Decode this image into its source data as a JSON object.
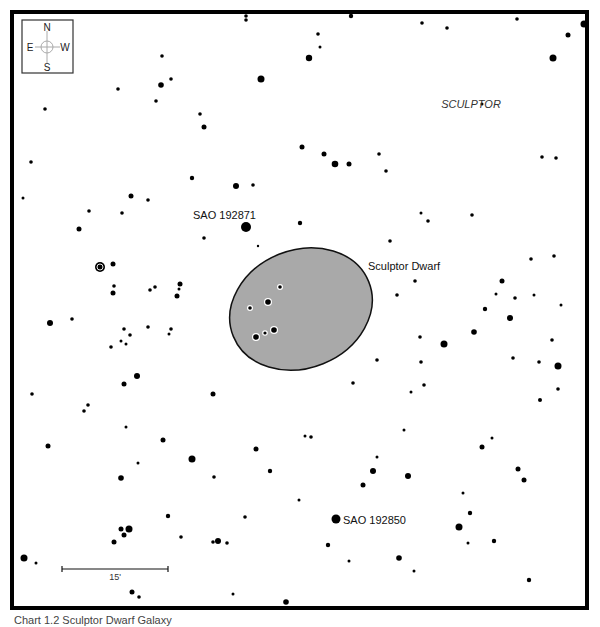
{
  "chart": {
    "constellation_label": "SCULPTOR",
    "galaxy": {
      "label": "Sculptor Dwarf",
      "fill": "#a9a9a9",
      "stroke": "#111111",
      "cx": 301,
      "cy": 309,
      "rx": 73,
      "ry": 59,
      "rotation": -22,
      "stars": [
        {
          "x": 280,
          "y": 287,
          "r": 1.8
        },
        {
          "x": 268,
          "y": 302,
          "r": 2.8
        },
        {
          "x": 250,
          "y": 308,
          "r": 1.8
        },
        {
          "x": 274,
          "y": 330,
          "r": 2.8
        },
        {
          "x": 265,
          "y": 333,
          "r": 1.6
        },
        {
          "x": 256,
          "y": 337,
          "r": 2.8
        }
      ]
    },
    "labeled_stars": [
      {
        "name": "SAO 192871",
        "x": 246,
        "y": 227,
        "r": 5,
        "label_x": 193,
        "label_y": 219
      },
      {
        "name": "SAO 192850",
        "x": 336,
        "y": 519,
        "r": 4.5,
        "label_x": 343,
        "label_y": 524
      }
    ],
    "variable_star": {
      "x": 100,
      "y": 267,
      "r": 5
    },
    "compass": {
      "n": "N",
      "s": "S",
      "e": "E",
      "w": "W"
    },
    "scale_bar": {
      "label": "15'",
      "x1": 62,
      "x2": 168,
      "y": 569
    },
    "caption": "Chart 1.2 Sculptor Dwarf Galaxy",
    "stars": [
      {
        "x": 246,
        "y": 16,
        "r": 1.8
      },
      {
        "x": 246,
        "y": 20,
        "r": 1.8
      },
      {
        "x": 162,
        "y": 56,
        "r": 1.8
      },
      {
        "x": 171,
        "y": 79,
        "r": 1.8
      },
      {
        "x": 161,
        "y": 85,
        "r": 2.8
      },
      {
        "x": 118,
        "y": 89,
        "r": 1.8
      },
      {
        "x": 156,
        "y": 101,
        "r": 1.8
      },
      {
        "x": 45,
        "y": 109,
        "r": 1.8
      },
      {
        "x": 200,
        "y": 114,
        "r": 1.8
      },
      {
        "x": 204,
        "y": 127,
        "r": 2.5
      },
      {
        "x": 261,
        "y": 79,
        "r": 3.5
      },
      {
        "x": 309,
        "y": 58,
        "r": 3.2
      },
      {
        "x": 302,
        "y": 147,
        "r": 2.5
      },
      {
        "x": 31,
        "y": 162,
        "r": 1.8
      },
      {
        "x": 192,
        "y": 178,
        "r": 2.2
      },
      {
        "x": 236,
        "y": 186,
        "r": 3
      },
      {
        "x": 253,
        "y": 185,
        "r": 1.8
      },
      {
        "x": 23,
        "y": 198,
        "r": 1.5
      },
      {
        "x": 131,
        "y": 196,
        "r": 2.5
      },
      {
        "x": 148,
        "y": 200,
        "r": 1.8
      },
      {
        "x": 351,
        "y": 16,
        "r": 2.2
      },
      {
        "x": 318,
        "y": 34,
        "r": 1.8
      },
      {
        "x": 320,
        "y": 47,
        "r": 1.5
      },
      {
        "x": 422,
        "y": 23,
        "r": 1.8
      },
      {
        "x": 447,
        "y": 28,
        "r": 1.8
      },
      {
        "x": 517,
        "y": 19,
        "r": 1.8
      },
      {
        "x": 584,
        "y": 24,
        "r": 3.5
      },
      {
        "x": 568,
        "y": 35,
        "r": 2.5
      },
      {
        "x": 553,
        "y": 58,
        "r": 3.5
      },
      {
        "x": 482,
        "y": 104,
        "r": 1.5
      },
      {
        "x": 324,
        "y": 154,
        "r": 2.5
      },
      {
        "x": 335,
        "y": 164,
        "r": 3.3
      },
      {
        "x": 349,
        "y": 164,
        "r": 2.5
      },
      {
        "x": 379,
        "y": 154,
        "r": 1.8
      },
      {
        "x": 386,
        "y": 171,
        "r": 1.8
      },
      {
        "x": 542,
        "y": 157,
        "r": 1.8
      },
      {
        "x": 556,
        "y": 158,
        "r": 1.8
      },
      {
        "x": 89,
        "y": 211,
        "r": 1.8
      },
      {
        "x": 122,
        "y": 213,
        "r": 1.8
      },
      {
        "x": 79,
        "y": 229,
        "r": 2.5
      },
      {
        "x": 204,
        "y": 238,
        "r": 1.8
      },
      {
        "x": 300,
        "y": 223,
        "r": 2.2
      },
      {
        "x": 258,
        "y": 246,
        "r": 1.2
      },
      {
        "x": 113,
        "y": 264,
        "r": 2.5
      },
      {
        "x": 114,
        "y": 286,
        "r": 1.8
      },
      {
        "x": 113,
        "y": 293,
        "r": 2.5
      },
      {
        "x": 150,
        "y": 290,
        "r": 1.8
      },
      {
        "x": 155,
        "y": 287,
        "r": 1.8
      },
      {
        "x": 180,
        "y": 284,
        "r": 2.5
      },
      {
        "x": 179,
        "y": 289,
        "r": 1.5
      },
      {
        "x": 177,
        "y": 296,
        "r": 2.5
      },
      {
        "x": 50,
        "y": 323,
        "r": 3
      },
      {
        "x": 72,
        "y": 319,
        "r": 1.8
      },
      {
        "x": 124,
        "y": 329,
        "r": 1.8
      },
      {
        "x": 130,
        "y": 335,
        "r": 1.8
      },
      {
        "x": 121,
        "y": 341,
        "r": 1.5
      },
      {
        "x": 126,
        "y": 344,
        "r": 1.5
      },
      {
        "x": 148,
        "y": 327,
        "r": 1.8
      },
      {
        "x": 171,
        "y": 329,
        "r": 1.8
      },
      {
        "x": 169,
        "y": 334,
        "r": 1.5
      },
      {
        "x": 111,
        "y": 347,
        "r": 1.8
      },
      {
        "x": 137,
        "y": 376,
        "r": 3
      },
      {
        "x": 124,
        "y": 384,
        "r": 2.5
      },
      {
        "x": 32,
        "y": 394,
        "r": 1.8
      },
      {
        "x": 88,
        "y": 405,
        "r": 1.8
      },
      {
        "x": 84,
        "y": 411,
        "r": 1.8
      },
      {
        "x": 213,
        "y": 394,
        "r": 2.5
      },
      {
        "x": 421,
        "y": 213,
        "r": 1.5
      },
      {
        "x": 428,
        "y": 221,
        "r": 1.8
      },
      {
        "x": 472,
        "y": 215,
        "r": 1.8
      },
      {
        "x": 390,
        "y": 241,
        "r": 1.8
      },
      {
        "x": 531,
        "y": 259,
        "r": 1.8
      },
      {
        "x": 554,
        "y": 256,
        "r": 1.8
      },
      {
        "x": 415,
        "y": 281,
        "r": 1.8
      },
      {
        "x": 397,
        "y": 295,
        "r": 1.8
      },
      {
        "x": 502,
        "y": 281,
        "r": 2.5
      },
      {
        "x": 496,
        "y": 294,
        "r": 1.5
      },
      {
        "x": 515,
        "y": 298,
        "r": 1.8
      },
      {
        "x": 534,
        "y": 295,
        "r": 1.5
      },
      {
        "x": 561,
        "y": 305,
        "r": 1.5
      },
      {
        "x": 485,
        "y": 309,
        "r": 2.2
      },
      {
        "x": 510,
        "y": 318,
        "r": 3
      },
      {
        "x": 474,
        "y": 332,
        "r": 2.8
      },
      {
        "x": 444,
        "y": 344,
        "r": 3.5
      },
      {
        "x": 420,
        "y": 337,
        "r": 1.8
      },
      {
        "x": 552,
        "y": 340,
        "r": 1.8
      },
      {
        "x": 377,
        "y": 360,
        "r": 1.8
      },
      {
        "x": 421,
        "y": 362,
        "r": 1.8
      },
      {
        "x": 513,
        "y": 358,
        "r": 1.8
      },
      {
        "x": 539,
        "y": 362,
        "r": 1.8
      },
      {
        "x": 558,
        "y": 366,
        "r": 3.5
      },
      {
        "x": 424,
        "y": 385,
        "r": 1.8
      },
      {
        "x": 411,
        "y": 392,
        "r": 1.5
      },
      {
        "x": 558,
        "y": 389,
        "r": 1.8
      },
      {
        "x": 540,
        "y": 400,
        "r": 2
      },
      {
        "x": 126,
        "y": 427,
        "r": 1.5
      },
      {
        "x": 48,
        "y": 446,
        "r": 2.5
      },
      {
        "x": 163,
        "y": 440,
        "r": 2.5
      },
      {
        "x": 192,
        "y": 459,
        "r": 3.5
      },
      {
        "x": 138,
        "y": 463,
        "r": 1.5
      },
      {
        "x": 121,
        "y": 478,
        "r": 2.8
      },
      {
        "x": 214,
        "y": 477,
        "r": 1.8
      },
      {
        "x": 256,
        "y": 449,
        "r": 2.5
      },
      {
        "x": 270,
        "y": 471,
        "r": 2.2
      },
      {
        "x": 299,
        "y": 500,
        "r": 1.5
      },
      {
        "x": 168,
        "y": 516,
        "r": 2.2
      },
      {
        "x": 245,
        "y": 517,
        "r": 1.8
      },
      {
        "x": 121,
        "y": 529,
        "r": 2.5
      },
      {
        "x": 124,
        "y": 535,
        "r": 2.5
      },
      {
        "x": 129,
        "y": 529,
        "r": 3.5
      },
      {
        "x": 114,
        "y": 542,
        "r": 2.5
      },
      {
        "x": 181,
        "y": 537,
        "r": 1.8
      },
      {
        "x": 213,
        "y": 542,
        "r": 1.8
      },
      {
        "x": 218,
        "y": 541,
        "r": 3
      },
      {
        "x": 227,
        "y": 543,
        "r": 1.8
      },
      {
        "x": 24,
        "y": 558,
        "r": 3.5
      },
      {
        "x": 36,
        "y": 563,
        "r": 1.5
      },
      {
        "x": 132,
        "y": 592,
        "r": 2.5
      },
      {
        "x": 139,
        "y": 597,
        "r": 1.8
      },
      {
        "x": 233,
        "y": 594,
        "r": 1.5
      },
      {
        "x": 286,
        "y": 602,
        "r": 2.8
      },
      {
        "x": 305,
        "y": 436,
        "r": 1.5
      },
      {
        "x": 311,
        "y": 437,
        "r": 1.8
      },
      {
        "x": 353,
        "y": 383,
        "r": 1.8
      },
      {
        "x": 404,
        "y": 430,
        "r": 1.5
      },
      {
        "x": 377,
        "y": 457,
        "r": 1.5
      },
      {
        "x": 482,
        "y": 447,
        "r": 2.5
      },
      {
        "x": 492,
        "y": 438,
        "r": 1.5
      },
      {
        "x": 373,
        "y": 471,
        "r": 3
      },
      {
        "x": 408,
        "y": 476,
        "r": 3
      },
      {
        "x": 363,
        "y": 485,
        "r": 2.5
      },
      {
        "x": 518,
        "y": 469,
        "r": 2.5
      },
      {
        "x": 524,
        "y": 480,
        "r": 2.5
      },
      {
        "x": 463,
        "y": 493,
        "r": 1.5
      },
      {
        "x": 470,
        "y": 513,
        "r": 2.2
      },
      {
        "x": 459,
        "y": 527,
        "r": 3.5
      },
      {
        "x": 328,
        "y": 545,
        "r": 2.2
      },
      {
        "x": 468,
        "y": 543,
        "r": 1.5
      },
      {
        "x": 494,
        "y": 541,
        "r": 2.2
      },
      {
        "x": 349,
        "y": 561,
        "r": 1.5
      },
      {
        "x": 399,
        "y": 558,
        "r": 2.8
      },
      {
        "x": 414,
        "y": 571,
        "r": 1.5
      },
      {
        "x": 529,
        "y": 580,
        "r": 2.2
      }
    ]
  }
}
